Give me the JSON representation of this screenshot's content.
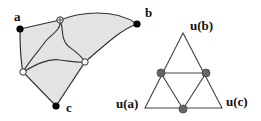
{
  "figure": {
    "left_panel": {
      "description": "Shaded region with three marked vertices and curved paths",
      "labels": {
        "a": "a",
        "b": "b",
        "c": "c"
      },
      "colors": {
        "region_fill": "#e3e3e3",
        "stroke": "#333333",
        "vertex": "#000000",
        "open_marker": "#ffffff"
      }
    },
    "right_panel": {
      "description": "Triangle subdivided into four with midpoints marked",
      "labels": {
        "top": "u(b)",
        "left": "u(a)",
        "right": "u(c)"
      },
      "colors": {
        "stroke": "#444444",
        "midpoint_fill": "#666666"
      }
    }
  }
}
